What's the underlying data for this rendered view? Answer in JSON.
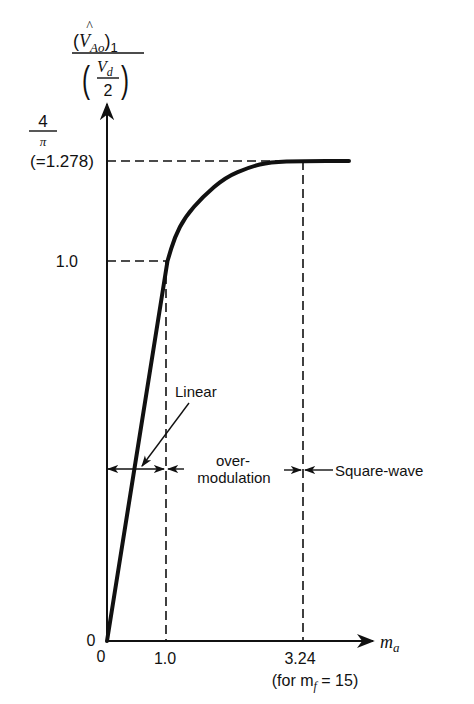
{
  "figure": {
    "y_axis_label": {
      "numerator": {
        "open": "(",
        "symbol": "V",
        "hat": "^",
        "subscript": "Ao",
        "close": ")",
        "outer_subscript": "1"
      },
      "denominator": {
        "open": "(",
        "symbol": "V",
        "subscript": "d",
        "divisor": "2",
        "close": ")"
      }
    },
    "y_ticks": {
      "saturation_numerator": "4",
      "saturation_denominator": "π",
      "saturation_value": "(=1.278)",
      "one": "1.0",
      "zero": "0"
    },
    "x_ticks": {
      "zero": "0",
      "one": "1.0",
      "square_wave_start": "3.24",
      "square_wave_note": "(for m",
      "square_wave_note_sub": "f",
      "square_wave_note_end": " = 15)"
    },
    "x_axis_label": {
      "symbol": "m",
      "subscript": "a"
    },
    "regions": {
      "linear": "Linear",
      "overmodulation_line1": "over-",
      "overmodulation_line2": "modulation",
      "square_wave": "Square-wave"
    }
  },
  "chart_data": {
    "type": "line",
    "title": "",
    "xlabel": "m_a",
    "ylabel": "(V̂_Ao)_1 / (V_d/2)",
    "x": [
      0,
      1.0,
      1.12,
      1.29,
      1.58,
      1.96,
      2.36,
      2.69,
      3.24,
      4.0
    ],
    "y": [
      0,
      1.0,
      1.067,
      1.122,
      1.178,
      1.233,
      1.261,
      1.275,
      1.278,
      1.278
    ],
    "x_ticks": [
      0,
      1.0,
      3.24
    ],
    "x_tick_labels": [
      "0",
      "1.0",
      "3.24 (for m_f = 15)"
    ],
    "y_ticks": [
      0,
      1.0,
      1.278
    ],
    "y_tick_labels": [
      "0",
      "1.0",
      "4/π (=1.278)"
    ],
    "reference_lines": [
      {
        "orientation": "horizontal",
        "y": 1.0,
        "style": "dashed"
      },
      {
        "orientation": "horizontal",
        "y": 1.278,
        "style": "dashed"
      },
      {
        "orientation": "vertical",
        "x": 1.0,
        "style": "dashed"
      },
      {
        "orientation": "vertical",
        "x": 3.24,
        "style": "dashed"
      }
    ],
    "regions": [
      {
        "name": "Linear",
        "x_range": [
          0,
          1.0
        ]
      },
      {
        "name": "over-modulation",
        "x_range": [
          1.0,
          3.24
        ]
      },
      {
        "name": "Square-wave",
        "x_range": [
          3.24,
          null
        ]
      }
    ],
    "grid": false,
    "legend": "none"
  }
}
